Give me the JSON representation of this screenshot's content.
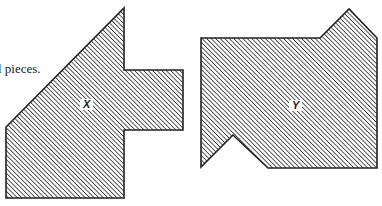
{
  "caption": "l pieces.",
  "figures": [
    {
      "id": "X",
      "label": "X",
      "points": "124,8 124,70 183,70 183,130 124,130 124,198 6,198 6,127",
      "label_pos": {
        "left": 80,
        "top": 99
      }
    },
    {
      "id": "Y",
      "label": "Y",
      "points": "201,38 320,38 349,9 377,38 377,168 268,168 233,135 201,167",
      "label_pos": {
        "left": 289,
        "top": 100
      }
    }
  ],
  "style": {
    "stroke": "#222222",
    "hatch_color": "#3a3a3a",
    "background": "#ffffff"
  }
}
